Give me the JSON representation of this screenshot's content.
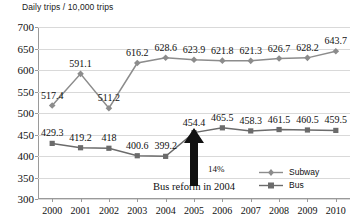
{
  "chart_data": {
    "type": "line",
    "title": "",
    "ylabel": "Daily trips / 10,000 trips",
    "xlabel": "",
    "ylim": [
      300,
      700
    ],
    "yticks": [
      300,
      350,
      400,
      450,
      500,
      550,
      600,
      650,
      700
    ],
    "grid": true,
    "legend_position": "bottom-right",
    "categories": [
      "2000",
      "2001",
      "2002",
      "2003",
      "2004",
      "2005",
      "2006",
      "2007",
      "2008",
      "2009",
      "2010"
    ],
    "series": [
      {
        "name": "Subway",
        "color": "#8c8c8c",
        "marker": "diamond",
        "values": [
          517.4,
          591.1,
          511.2,
          616.2,
          628.6,
          623.9,
          621.8,
          621.3,
          626.7,
          628.2,
          643.7
        ],
        "labels": [
          "517.4",
          "591.1",
          "511.2",
          "616.2",
          "628.6",
          "623.9",
          "621.8",
          "621.3",
          "626.7",
          "628.2",
          "643.7"
        ]
      },
      {
        "name": "Bus",
        "color": "#6b6b6b",
        "marker": "square",
        "values": [
          429.3,
          419.2,
          418,
          400.6,
          399.2,
          454.4,
          465.5,
          458.3,
          461.5,
          460.5,
          459.5
        ],
        "labels": [
          "429.3",
          "419.2",
          "418",
          "400.6",
          "399.2",
          "454.4",
          "465.5",
          "458.3",
          "461.5",
          "460.5",
          "459.5"
        ]
      }
    ],
    "annotations": [
      {
        "name": "growth-percent",
        "text": "14%"
      },
      {
        "name": "reform-caption",
        "text": "Bus reform in 2004"
      }
    ]
  },
  "legend": {
    "items": [
      {
        "label": "Subway"
      },
      {
        "label": "Bus"
      }
    ]
  }
}
